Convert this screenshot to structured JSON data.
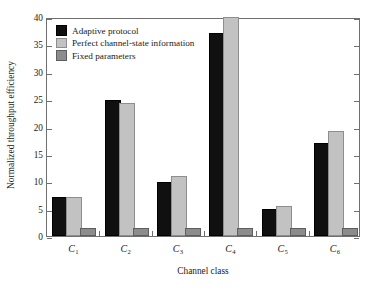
{
  "chart_data": {
    "type": "bar",
    "title": "",
    "xlabel": "Channel class",
    "ylabel": "Normalized throughput efficiency",
    "categories": [
      "C_1",
      "C_2",
      "C_3",
      "C_4",
      "C_5",
      "C_6"
    ],
    "category_labels": [
      {
        "base": "C",
        "sub": "1"
      },
      {
        "base": "C",
        "sub": "2"
      },
      {
        "base": "C",
        "sub": "3"
      },
      {
        "base": "C",
        "sub": "4"
      },
      {
        "base": "C",
        "sub": "5"
      },
      {
        "base": "C",
        "sub": "6"
      }
    ],
    "series": [
      {
        "name": "Adaptive protocol",
        "color": "#101010",
        "values": [
          6.7,
          24.5,
          9.5,
          36.8,
          4.5,
          16.7
        ]
      },
      {
        "name": "Perfect channel-state information",
        "color": "#c2c2c2",
        "values": [
          6.7,
          23.9,
          10.6,
          39.6,
          5.1,
          18.9
        ]
      },
      {
        "name": "Fixed parameters",
        "color": "#8c8c8c",
        "values": [
          1.1,
          1.1,
          1.1,
          1.1,
          1.1,
          1.1
        ]
      }
    ],
    "ylim": [
      0,
      40
    ],
    "yticks": [
      0,
      5,
      10,
      15,
      20,
      25,
      30,
      35,
      40
    ],
    "ytick_labels": [
      "0",
      "5",
      "10",
      "15",
      "20",
      "25",
      "30",
      "35",
      "40"
    ],
    "grid": false,
    "legend_position": "upper left",
    "frame": "full-box",
    "tick_direction": "in-out"
  }
}
